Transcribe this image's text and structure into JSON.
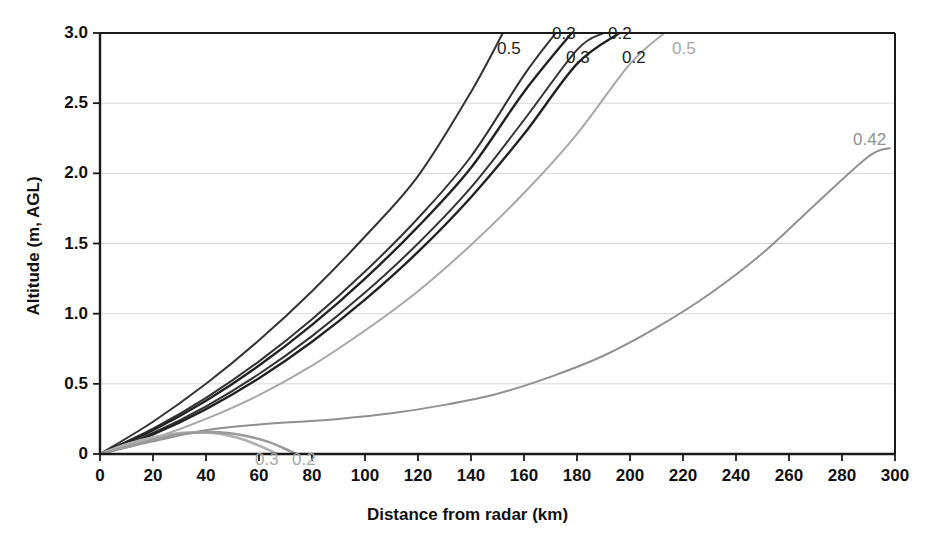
{
  "chart_data": {
    "type": "line",
    "title": "",
    "xlabel": "Distance from radar (km)",
    "ylabel": "Altitude (m, AGL)",
    "xlim": [
      0,
      300
    ],
    "ylim": [
      0,
      3.0
    ],
    "xticks": [
      0,
      20,
      40,
      60,
      80,
      100,
      120,
      140,
      160,
      180,
      200,
      220,
      240,
      260,
      280,
      300
    ],
    "yticks": [
      0,
      0.5,
      1.0,
      1.5,
      2.0,
      2.5,
      3.0
    ],
    "xtick_labels": [
      "0",
      "20",
      "40",
      "60",
      "80",
      "100",
      "120",
      "140",
      "160",
      "180",
      "200",
      "220",
      "240",
      "260",
      "280",
      "300"
    ],
    "ytick_labels": [
      "0",
      "0.5",
      "1.0",
      "1.5",
      "2.0",
      "2.5",
      "3.0"
    ],
    "grid": "horizontal",
    "legend": "none",
    "annotations": [
      {
        "text": "0.5",
        "x": 148,
        "y": 2.92,
        "color": "#222222",
        "role": "beam-label-dark-05"
      },
      {
        "text": "0.3",
        "x": 183,
        "y": 3.0,
        "color": "#222222",
        "role": "beam-label-dark-03-upper"
      },
      {
        "text": "0.2",
        "x": 204,
        "y": 3.0,
        "color": "#222222",
        "role": "beam-label-dark-02-upper"
      },
      {
        "text": "0.3",
        "x": 190,
        "y": 2.83,
        "color": "#222222",
        "role": "beam-label-dark-03-lower"
      },
      {
        "text": "0.2",
        "x": 211,
        "y": 2.83,
        "color": "#222222",
        "role": "beam-label-dark-02-lower"
      },
      {
        "text": "0.5",
        "x": 233,
        "y": 2.92,
        "color": "#a8a8a8",
        "role": "beam-label-gray-05"
      },
      {
        "text": "0.42",
        "x": 288,
        "y": 2.22,
        "color": "#909090",
        "role": "beam-label-gray-042"
      },
      {
        "text": "0.3",
        "x": 64,
        "y": -0.13,
        "color": "#b5b5b5",
        "role": "beam-label-gray-03-ground"
      },
      {
        "text": "0.2",
        "x": 76,
        "y": -0.13,
        "color": "#b5b5b5",
        "role": "beam-label-gray-02-ground"
      }
    ],
    "series": [
      {
        "name": "0.5 deg beam (dark)",
        "label": "0.5",
        "color": "#333333",
        "width": 2,
        "x": [
          0,
          20,
          40,
          60,
          80,
          100,
          120,
          140,
          152
        ],
        "y": [
          0,
          0.23,
          0.5,
          0.81,
          1.16,
          1.55,
          1.98,
          2.58,
          3.0
        ]
      },
      {
        "name": "0.3 deg beam upper (dark)",
        "label": "0.3",
        "color": "#333333",
        "width": 2,
        "x": [
          0,
          20,
          40,
          60,
          80,
          100,
          120,
          140,
          160,
          172
        ],
        "y": [
          0,
          0.18,
          0.4,
          0.66,
          0.96,
          1.3,
          1.68,
          2.12,
          2.7,
          3.0
        ]
      },
      {
        "name": "0.3 deg beam lower (dark)",
        "label": "0.3",
        "color": "#222222",
        "width": 2.4,
        "x": [
          0,
          20,
          40,
          60,
          80,
          100,
          120,
          140,
          160,
          178
        ],
        "y": [
          0,
          0.17,
          0.38,
          0.63,
          0.92,
          1.25,
          1.62,
          2.04,
          2.58,
          3.0
        ]
      },
      {
        "name": "0.2 deg beam upper (dark)",
        "label": "0.2",
        "color": "#333333",
        "width": 2,
        "x": [
          0,
          20,
          40,
          60,
          80,
          100,
          120,
          140,
          160,
          180,
          190
        ],
        "y": [
          0,
          0.15,
          0.34,
          0.57,
          0.84,
          1.15,
          1.5,
          1.9,
          2.38,
          2.88,
          3.0
        ]
      },
      {
        "name": "0.2 deg beam lower (dark)",
        "label": "0.2",
        "color": "#222222",
        "width": 2.4,
        "x": [
          0,
          20,
          40,
          60,
          80,
          100,
          120,
          140,
          160,
          180,
          196
        ],
        "y": [
          0,
          0.14,
          0.32,
          0.54,
          0.8,
          1.1,
          1.44,
          1.83,
          2.28,
          2.78,
          3.0
        ]
      },
      {
        "name": "0.5 deg beam (gray)",
        "label": "0.5",
        "color": "#a8a8a8",
        "width": 2,
        "x": [
          0,
          20,
          40,
          60,
          80,
          100,
          120,
          140,
          160,
          180,
          200,
          213
        ],
        "y": [
          0,
          0.11,
          0.25,
          0.42,
          0.63,
          0.88,
          1.16,
          1.49,
          1.86,
          2.28,
          2.78,
          3.0
        ]
      },
      {
        "name": "0.42 deg beam (gray)",
        "label": "0.42",
        "color": "#909090",
        "width": 2,
        "x": [
          0,
          20,
          40,
          60,
          75,
          90,
          110,
          130,
          150,
          170,
          190,
          210,
          230,
          250,
          270,
          290,
          298
        ],
        "y": [
          0,
          0.09,
          0.17,
          0.21,
          0.23,
          0.25,
          0.29,
          0.35,
          0.43,
          0.55,
          0.7,
          0.9,
          1.14,
          1.43,
          1.78,
          2.12,
          2.18
        ]
      },
      {
        "name": "0.3 deg beam blocked (gray)",
        "label": "0.3",
        "color": "#b0b0b0",
        "width": 2.6,
        "x": [
          0,
          10,
          20,
          30,
          38,
          45,
          52,
          58,
          63,
          67
        ],
        "y": [
          0,
          0.07,
          0.12,
          0.15,
          0.155,
          0.145,
          0.115,
          0.075,
          0.035,
          0.0
        ]
      },
      {
        "name": "0.2 deg beam blocked (gray)",
        "label": "0.2",
        "color": "#9a9a9a",
        "width": 2.6,
        "x": [
          0,
          10,
          20,
          30,
          40,
          48,
          56,
          63,
          69,
          74
        ],
        "y": [
          0,
          0.05,
          0.1,
          0.14,
          0.155,
          0.15,
          0.125,
          0.09,
          0.045,
          0.0
        ]
      }
    ]
  },
  "axes": {
    "y_title": "Altitude (m, AGL)",
    "x_title": "Distance from radar (km)"
  },
  "colors": {
    "axis": "#1a1a1a",
    "grid": "#d8d8d8",
    "dark_beam": "#2a2a2a",
    "gray_beam": "#a8a8a8",
    "background": "#ffffff"
  }
}
